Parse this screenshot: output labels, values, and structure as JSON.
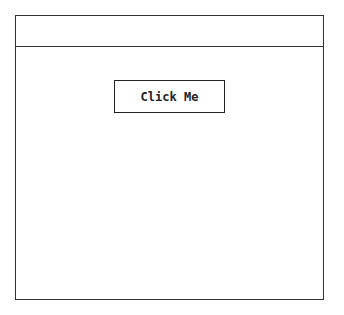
{
  "header": {
    "title": ""
  },
  "main": {
    "button_label": "Click Me"
  }
}
